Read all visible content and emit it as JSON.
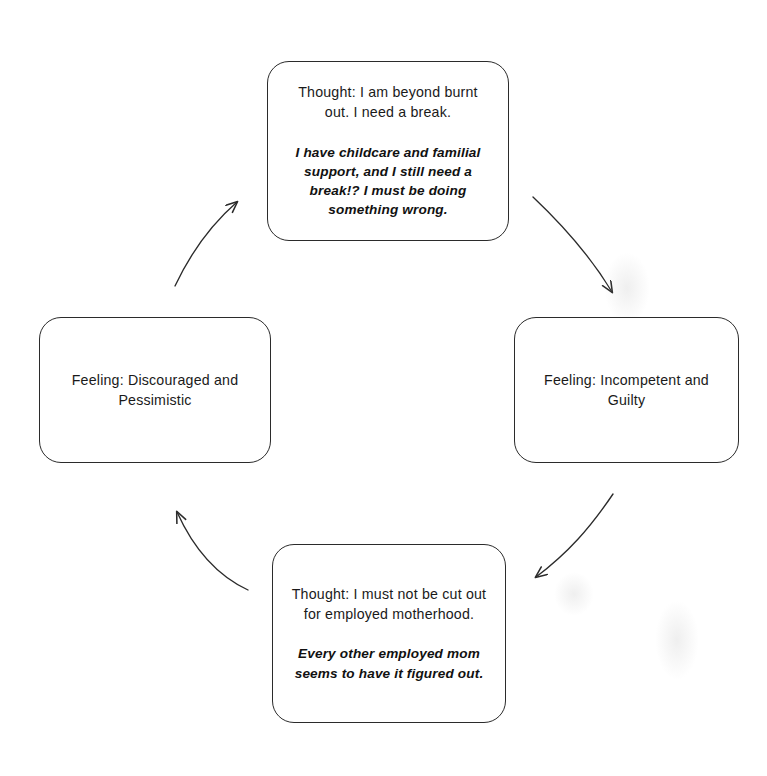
{
  "diagram": {
    "type": "cycle",
    "direction": "clockwise",
    "stroke_color": "#2b2b2b",
    "background_color": "#ffffff",
    "nodes": [
      {
        "id": "thought-top",
        "position": "top",
        "primary": "Thought: I am beyond burnt out. I need a break.",
        "secondary": "I have childcare and familial support, and I still need a break!? I must be doing something wrong."
      },
      {
        "id": "feeling-right",
        "position": "right",
        "primary": "Feeling: Incompetent and Guilty",
        "secondary": ""
      },
      {
        "id": "thought-bottom",
        "position": "bottom",
        "primary": "Thought: I must not be cut out for employed motherhood.",
        "secondary": "Every other employed mom seems to have it figured out."
      },
      {
        "id": "feeling-left",
        "position": "left",
        "primary": "Feeling: Discouraged and Pessimistic",
        "secondary": ""
      }
    ],
    "arrows": [
      {
        "id": "arrow-top-to-right",
        "from": "thought-top",
        "to": "feeling-right",
        "label": ""
      },
      {
        "id": "arrow-right-to-bottom",
        "from": "feeling-right",
        "to": "thought-bottom",
        "label": ""
      },
      {
        "id": "arrow-bottom-to-left",
        "from": "thought-bottom",
        "to": "feeling-left",
        "label": ""
      },
      {
        "id": "arrow-left-to-top",
        "from": "feeling-left",
        "to": "thought-top",
        "label": ""
      }
    ]
  }
}
